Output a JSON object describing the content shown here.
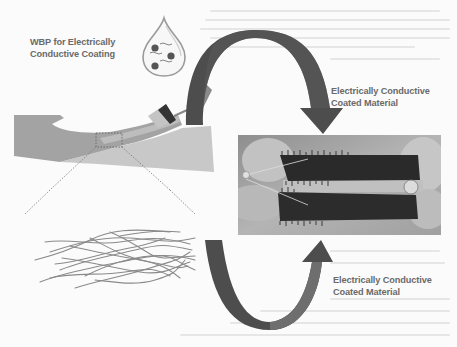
{
  "figure": {
    "type": "schematic diagram",
    "labels": {
      "wbp": [
        "WBP for Electrically",
        "Conductive Coating"
      ],
      "top_arrow": [
        "Electrically Conductive",
        "Coated Material"
      ],
      "bottom_arrow": [
        "Electrically Conductive",
        "Coated Material"
      ]
    },
    "elements": {
      "droplet": "water-droplet-icon",
      "brush": "paintbrush-icon",
      "substrate": "substrate-strip",
      "zoom_box": "dotted-zoom-box",
      "fiber_network": "fiber-network",
      "photo": "coated-material-photo",
      "top_arrow": "curved-arrow-down",
      "bottom_arrow": "curved-arrow-up"
    },
    "colors": {
      "arrow": "#4d4d4d",
      "arrow_light": "#6e6e6e",
      "label_text": "#6a6a6a",
      "substrate": "#a9a9a9",
      "substrate_light": "#c9c9c9",
      "fiber": "#8a8a8a"
    }
  }
}
